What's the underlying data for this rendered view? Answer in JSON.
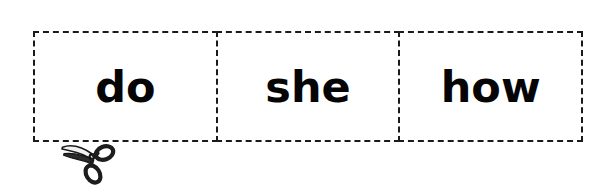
{
  "worksheet": {
    "type": "sight-word-cut-out-strip",
    "background_color": "#ffffff",
    "ink_color": "#050505",
    "border_style": "dashed",
    "border_color": "#1a1a1a",
    "cells": [
      {
        "word": "do"
      },
      {
        "word": "she"
      },
      {
        "word": "how"
      }
    ],
    "cut_icon": {
      "name": "scissors-icon",
      "position": "bottom-left",
      "meaning": "cut along dashed line"
    },
    "watermark": {
      "text": "",
      "color": "#fbfbfb"
    }
  }
}
